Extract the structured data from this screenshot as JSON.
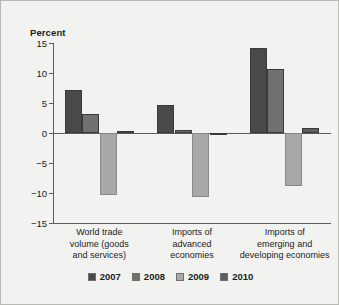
{
  "chart_data": {
    "type": "bar",
    "title": "",
    "subtitle": "",
    "ylabel": "Percent",
    "xlabel": "",
    "ylim": [
      -15,
      15
    ],
    "yticks": [
      15,
      10,
      5,
      0,
      -5,
      -10,
      -15
    ],
    "ytick_labels": [
      "15",
      "10",
      "5",
      "0",
      "−5",
      "−10",
      "−15"
    ],
    "grid": false,
    "legend_position": "bottom",
    "categories": [
      "World trade\nvolume (goods\nand services)",
      "Imports of\nadvanced\neconomies",
      "Imports of\nemerging and\ndeveloping economies"
    ],
    "series": [
      {
        "name": "2007",
        "color": "#4a4a4a",
        "values": [
          7.1,
          4.6,
          14.2
        ]
      },
      {
        "name": "2008",
        "color": "#707070",
        "values": [
          3.2,
          0.5,
          10.7
        ]
      },
      {
        "name": "2009",
        "color": "#a8a8a8",
        "values": [
          -10.3,
          -10.7,
          -8.8
        ]
      },
      {
        "name": "2010",
        "color": "#5e5e5e",
        "values": [
          0.4,
          0.05,
          0.8
        ]
      }
    ]
  },
  "axis": {
    "unit_label": "Percent"
  },
  "colors": {
    "background": "#f2f2f0",
    "border": "#b9b9b4",
    "axis": "#5d5d5d",
    "text": "#1c1c1c"
  }
}
